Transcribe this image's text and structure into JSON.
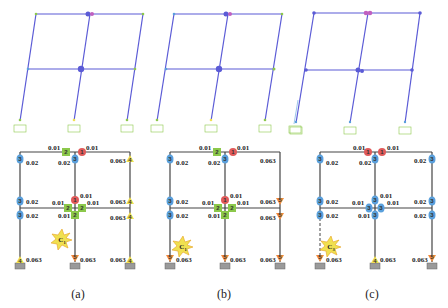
{
  "colors": {
    "frame_deformed": "#5b5bd6",
    "frame_lines": "#333333",
    "hinge_1": "#e05a5a",
    "hinge_2": "#8cc84b",
    "hinge_3": "#5aa0dc",
    "hinge_4": "#f0e050",
    "hinge_5": "#f08c3c",
    "support": "#9a9a9a"
  },
  "panels": [
    {
      "caption": "(a)",
      "collapse_label": "C1",
      "hinges": [
        {
          "id": "top-beam-left",
          "x": 63,
          "y": 149,
          "level": "2",
          "val": "0.01"
        },
        {
          "id": "top-beam-right",
          "x": 82,
          "y": 149,
          "level": "1",
          "val": "0.01"
        },
        {
          "id": "top-left-col",
          "x": 6,
          "y": 160,
          "level": "3",
          "val": "0.02"
        },
        {
          "id": "top-mid-col",
          "x": 73,
          "y": 160,
          "level": "3",
          "val": "0.02"
        },
        {
          "id": "top-right-col",
          "x": 129,
          "y": 160,
          "level": "4",
          "val": "0.063"
        },
        {
          "id": "mid-left-col-up",
          "x": 6,
          "y": 200,
          "level": "3",
          "val": "0.02"
        },
        {
          "id": "mid-mid-col-up",
          "x": 73,
          "y": 200,
          "level": "1",
          "val": "0.01"
        },
        {
          "id": "mid-right-col-up",
          "x": 129,
          "y": 200,
          "level": "4",
          "val": "0.063"
        },
        {
          "id": "mid-beam-left",
          "x": 68,
          "y": 207,
          "level": "2",
          "val": "0.01"
        },
        {
          "id": "mid-beam-right",
          "x": 82,
          "y": 207,
          "level": "2",
          "val": "0.01"
        },
        {
          "id": "mid-left-col-down",
          "x": 6,
          "y": 215,
          "level": "3",
          "val": "0.02"
        },
        {
          "id": "mid-mid-col-down",
          "x": 73,
          "y": 215,
          "level": "2",
          "val": "0.01"
        },
        {
          "id": "mid-right-col-down",
          "x": 129,
          "y": 218,
          "level": "4",
          "val": "0.063"
        },
        {
          "id": "base-left",
          "x": 6,
          "y": 260,
          "level": "4",
          "val": "0.063"
        },
        {
          "id": "base-mid",
          "x": 73,
          "y": 260,
          "level": "5",
          "val": "0.063"
        },
        {
          "id": "base-right",
          "x": 129,
          "y": 260,
          "level": "4",
          "val": "0.063"
        }
      ]
    },
    {
      "caption": "(b)",
      "collapse_label": "C1",
      "hinges": [
        {
          "id": "top-beam-left",
          "x": 68,
          "y": 149,
          "level": "2",
          "val": "0.01"
        },
        {
          "id": "top-beam-right",
          "x": 82,
          "y": 149,
          "level": "1",
          "val": "0.01"
        },
        {
          "id": "top-left-col",
          "x": 20,
          "y": 160,
          "level": "3",
          "val": "0.02"
        },
        {
          "id": "top-mid-col",
          "x": 75,
          "y": 160,
          "level": "3",
          "val": "0.02"
        },
        {
          "id": "top-right-col",
          "x": 130,
          "y": 160,
          "level": "none",
          "val": "0.063"
        },
        {
          "id": "mid-left-col-up",
          "x": 20,
          "y": 200,
          "level": "3",
          "val": "0.02"
        },
        {
          "id": "mid-mid-col-up",
          "x": 75,
          "y": 200,
          "level": "1",
          "val": "0.01"
        },
        {
          "id": "mid-right-col-up",
          "x": 130,
          "y": 200,
          "level": "5",
          "val": "0.063"
        },
        {
          "id": "mid-beam-left",
          "x": 68,
          "y": 207,
          "level": "2",
          "val": "0.01"
        },
        {
          "id": "mid-beam-right",
          "x": 82,
          "y": 207,
          "level": "2",
          "val": "0.01"
        },
        {
          "id": "mid-left-col-down",
          "x": 20,
          "y": 215,
          "level": "3",
          "val": "0.02"
        },
        {
          "id": "mid-mid-col-down",
          "x": 75,
          "y": 215,
          "level": "2",
          "val": "0.01"
        },
        {
          "id": "mid-right-col-down",
          "x": 130,
          "y": 218,
          "level": "5",
          "val": "0.063"
        },
        {
          "id": "base-left",
          "x": 20,
          "y": 260,
          "level": "5",
          "val": "0.063"
        },
        {
          "id": "base-mid",
          "x": 75,
          "y": 260,
          "level": "5",
          "val": "0.063"
        },
        {
          "id": "base-right",
          "x": 130,
          "y": 260,
          "level": "5",
          "val": "0.063"
        }
      ]
    },
    {
      "caption": "(c)",
      "collapse_label": "C3",
      "hinges": [
        {
          "id": "top-beam-left",
          "x": 80,
          "y": 149,
          "level": "1",
          "val": "0.01"
        },
        {
          "id": "top-beam-right",
          "x": 93,
          "y": 149,
          "level": "1",
          "val": "0.01"
        },
        {
          "id": "top-left-col",
          "x": 26,
          "y": 160,
          "level": "3",
          "val": "0.02"
        },
        {
          "id": "top-mid-col",
          "x": 85,
          "y": 160,
          "level": "3",
          "val": "0.02"
        },
        {
          "id": "top-right-col",
          "x": 142,
          "y": 160,
          "level": "3",
          "val": "0.02"
        },
        {
          "id": "mid-left-col-up",
          "x": 26,
          "y": 200,
          "level": "3",
          "val": "0.02"
        },
        {
          "id": "mid-mid-col-up",
          "x": 85,
          "y": 200,
          "level": "3",
          "val": "0.01"
        },
        {
          "id": "mid-right-col-up",
          "x": 142,
          "y": 200,
          "level": "3",
          "val": "0.02"
        },
        {
          "id": "mid-beam-left",
          "x": 80,
          "y": 207,
          "level": "3",
          "val": "0.01"
        },
        {
          "id": "mid-beam-right",
          "x": 92,
          "y": 207,
          "level": "3",
          "val": "0.01"
        },
        {
          "id": "mid-left-col-down",
          "x": 26,
          "y": 215,
          "level": "3",
          "val": "0.02"
        },
        {
          "id": "mid-mid-col-down",
          "x": 85,
          "y": 215,
          "level": "3",
          "val": "0.01"
        },
        {
          "id": "mid-right-col-down",
          "x": 142,
          "y": 215,
          "level": "3",
          "val": "0.02"
        },
        {
          "id": "base-left",
          "x": 26,
          "y": 260,
          "level": "5",
          "val": "0.063"
        },
        {
          "id": "base-mid",
          "x": 85,
          "y": 260,
          "level": "4",
          "val": "0.063"
        },
        {
          "id": "base-right",
          "x": 142,
          "y": 260,
          "level": "5",
          "val": "0.063"
        }
      ]
    }
  ]
}
